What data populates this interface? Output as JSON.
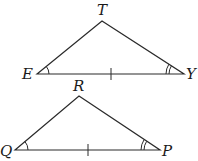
{
  "diagram": {
    "triangles": [
      {
        "name": "triangle-ETY",
        "vertices": {
          "E": {
            "label": "E",
            "x": 37,
            "y": 74
          },
          "T": {
            "label": "T",
            "x": 102,
            "y": 21
          },
          "Y": {
            "label": "Y",
            "x": 184,
            "y": 74
          }
        },
        "marks": {
          "single_arc_at": "E",
          "double_arc_at": "Y",
          "tick_on_side": "EY"
        }
      },
      {
        "name": "triangle-QRP",
        "vertices": {
          "Q": {
            "label": "Q",
            "x": 15,
            "y": 150
          },
          "R": {
            "label": "R",
            "x": 79,
            "y": 96
          },
          "P": {
            "label": "P",
            "x": 160,
            "y": 150
          }
        },
        "marks": {
          "single_arc_at": "Q",
          "double_arc_at": "P",
          "tick_on_side": "QP"
        }
      }
    ],
    "labels": {
      "T": "T",
      "E": "E",
      "Y": "Y",
      "R": "R",
      "Q": "Q",
      "P": "P"
    },
    "colors": {
      "stroke": "#2a2a2a",
      "background": "#ffffff"
    }
  }
}
